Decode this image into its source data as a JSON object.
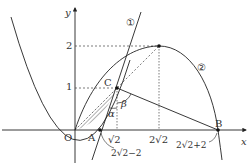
{
  "diagram": {
    "axes": {
      "x_label": "x",
      "y_label": "y",
      "origin_label": "O"
    },
    "y_ticks": [
      "1",
      "2"
    ],
    "x_ticks": [
      "√2",
      "2√2"
    ],
    "curve_labels": [
      "①",
      "②"
    ],
    "points": {
      "A": "A",
      "B": "B",
      "C": "C"
    },
    "angles": {
      "alpha": "α",
      "beta": "β"
    },
    "annotations": {
      "A_value": "2√2−2",
      "B_value": "2√2+2"
    }
  }
}
